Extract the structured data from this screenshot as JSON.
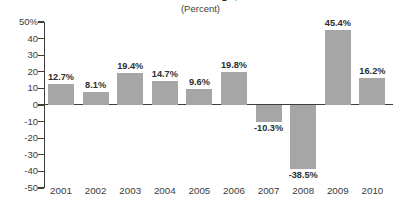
{
  "title": {
    "text": "Annual Percent Change, 2001-2010",
    "visible_note": "clipped at top edge"
  },
  "subtitle": "(Percent)",
  "chart_data": {
    "type": "bar",
    "title": "Annual Percent Change, 2001-2010",
    "subtitle": "(Percent)",
    "xlabel": "",
    "ylabel": "",
    "ylim": [
      -50,
      50
    ],
    "grid": false,
    "legend": null,
    "categories": [
      "2001",
      "2002",
      "2003",
      "2004",
      "2005",
      "2006",
      "2007",
      "2008",
      "2009",
      "2010"
    ],
    "values": [
      12.7,
      8.1,
      19.4,
      14.7,
      9.6,
      19.8,
      -10.3,
      -38.5,
      45.4,
      16.2
    ],
    "data_labels": [
      "12.7%",
      "8.1%",
      "19.4%",
      "14.7%",
      "9.6%",
      "19.8%",
      "-10.3%",
      "-38.5%",
      "45.4%",
      "16.2%"
    ],
    "ytick_labels": [
      "50%",
      "40",
      "30",
      "20",
      "10",
      "0",
      "-10",
      "-20",
      "-30",
      "-40",
      "-50"
    ],
    "ytick_values": [
      50,
      40,
      30,
      20,
      10,
      0,
      -10,
      -20,
      -30,
      -40,
      -50
    ],
    "bar_color": "#a6a6a6",
    "axis_color": "#3d3d3d",
    "text_color": "#3b3b3b"
  }
}
